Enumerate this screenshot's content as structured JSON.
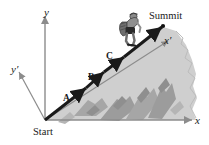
{
  "figure": {
    "background_color": "#ffffff",
    "axis_color": "#8c8c8c",
    "slope_color": "#1a1a1a",
    "mountain_fill": "#cfcfcf",
    "mountain_shadow": "#a6a6a6",
    "mountain_shadow_dark": "#8f8f8f",
    "label_color": "#1a1a1a"
  },
  "axes": {
    "y_label": "y",
    "y_prime_label": "y′",
    "x_label": "x",
    "x_prime_label": "x′"
  },
  "waypoints": [
    {
      "id": "A",
      "label": "A"
    },
    {
      "id": "B",
      "label": "B"
    },
    {
      "id": "C",
      "label": "C"
    }
  ],
  "endpoints": {
    "start_label": "Start",
    "summit_label": "Summit"
  },
  "icons": {
    "hiker": "hiker-with-backpack-icon",
    "summit_point": "summit-dot-icon"
  }
}
